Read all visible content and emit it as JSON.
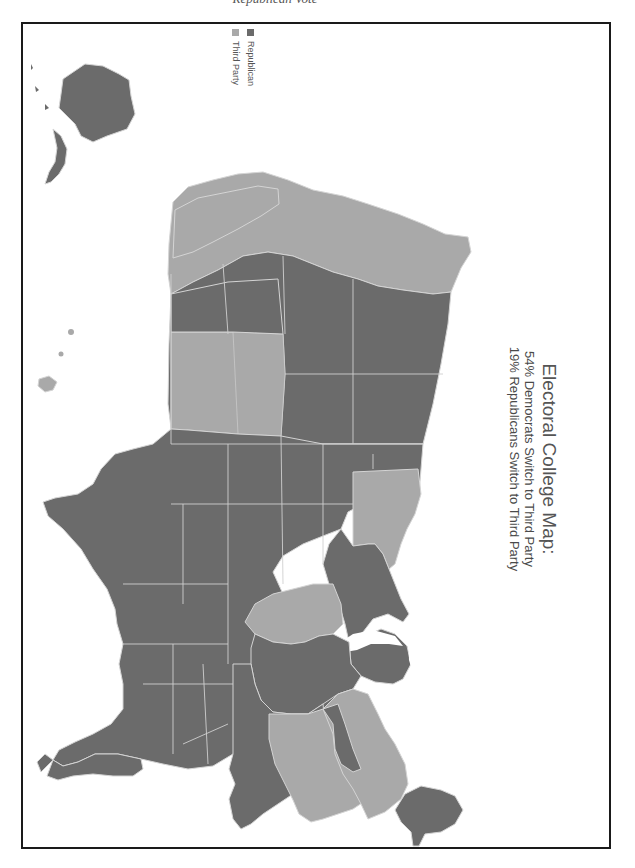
{
  "page": {
    "caption_top": "Republican Vote"
  },
  "map": {
    "title": "Electoral College Map:",
    "subtitle_1": "54% Democrats Switch to Third Party",
    "subtitle_2": "19% Republicans Switch to Third Party",
    "orientation": "rotated 90 degrees clockwise",
    "legend": [
      {
        "label": "Republican",
        "color": "#6b6b6b"
      },
      {
        "label": "Third Party",
        "color": "#a9a9a9"
      }
    ],
    "colors": {
      "republican": "#6b6b6b",
      "third_party": "#a9a9a9",
      "border": "#d8d8d8",
      "frame": "#1a1a1a"
    },
    "regions": [
      {
        "name": "Washington",
        "party": "Third Party"
      },
      {
        "name": "Oregon",
        "party": "Third Party"
      },
      {
        "name": "California",
        "party": "Third Party"
      },
      {
        "name": "Nevada",
        "party": "Third Party"
      },
      {
        "name": "Idaho",
        "party": "Republican"
      },
      {
        "name": "Montana",
        "party": "Republican"
      },
      {
        "name": "Wyoming",
        "party": "Republican"
      },
      {
        "name": "Utah",
        "party": "Republican"
      },
      {
        "name": "Arizona",
        "party": "Republican"
      },
      {
        "name": "Colorado",
        "party": "Third Party"
      },
      {
        "name": "New Mexico",
        "party": "Third Party"
      },
      {
        "name": "Alaska",
        "party": "Republican"
      },
      {
        "name": "Hawaii",
        "party": "Third Party"
      },
      {
        "name": "Texas",
        "party": "Republican"
      },
      {
        "name": "Oklahoma",
        "party": "Republican"
      },
      {
        "name": "Kansas",
        "party": "Republican"
      },
      {
        "name": "Nebraska",
        "party": "Republican"
      },
      {
        "name": "South Dakota",
        "party": "Republican"
      },
      {
        "name": "North Dakota",
        "party": "Republican"
      },
      {
        "name": "Minnesota",
        "party": "Third Party"
      },
      {
        "name": "Wisconsin",
        "party": "Republican"
      },
      {
        "name": "Iowa",
        "party": "Republican"
      },
      {
        "name": "Missouri",
        "party": "Republican"
      },
      {
        "name": "Arkansas",
        "party": "Republican"
      },
      {
        "name": "Louisiana",
        "party": "Republican"
      },
      {
        "name": "Illinois",
        "party": "Third Party"
      },
      {
        "name": "Michigan",
        "party": "Republican"
      },
      {
        "name": "Indiana",
        "party": "Republican"
      },
      {
        "name": "Ohio",
        "party": "Republican"
      },
      {
        "name": "Kentucky",
        "party": "Republican"
      },
      {
        "name": "Tennessee",
        "party": "Republican"
      },
      {
        "name": "Mississippi",
        "party": "Republican"
      },
      {
        "name": "Alabama",
        "party": "Republican"
      },
      {
        "name": "Georgia",
        "party": "Republican"
      },
      {
        "name": "Florida",
        "party": "Republican"
      },
      {
        "name": "South Carolina",
        "party": "Republican"
      },
      {
        "name": "North Carolina",
        "party": "Republican"
      },
      {
        "name": "Virginia",
        "party": "Third Party"
      },
      {
        "name": "West Virginia",
        "party": "Republican"
      },
      {
        "name": "Pennsylvania",
        "party": "Republican"
      },
      {
        "name": "New York",
        "party": "Third Party"
      },
      {
        "name": "New England",
        "party": "Third Party"
      },
      {
        "name": "Maine",
        "party": "Republican"
      }
    ]
  }
}
